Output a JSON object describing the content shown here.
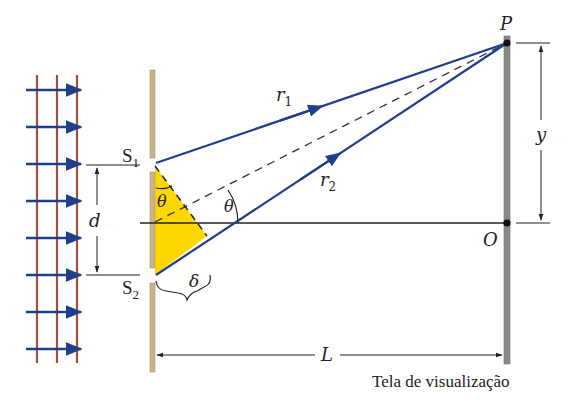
{
  "diagram": {
    "labels": {
      "S1": "S",
      "S1_sub": "1",
      "S2": "S",
      "S2_sub": "2",
      "d": "d",
      "theta_inner": "θ",
      "theta_outer": "θ",
      "delta": "δ",
      "r1": "r",
      "r1_sub": "1",
      "r2": "r",
      "r2_sub": "2",
      "P": "P",
      "O": "O",
      "y": "y",
      "L": "L"
    },
    "caption": "Tela de visualização",
    "colors": {
      "ray": "#1f3f8a",
      "wavefront": "#a0503a",
      "barrier": "#c9b48a",
      "screen": "#8a8a8a",
      "triangle": "#ffd700",
      "line": "#222222"
    },
    "incoming_arrows_count": 8,
    "wavefront_lines_count": 3
  }
}
